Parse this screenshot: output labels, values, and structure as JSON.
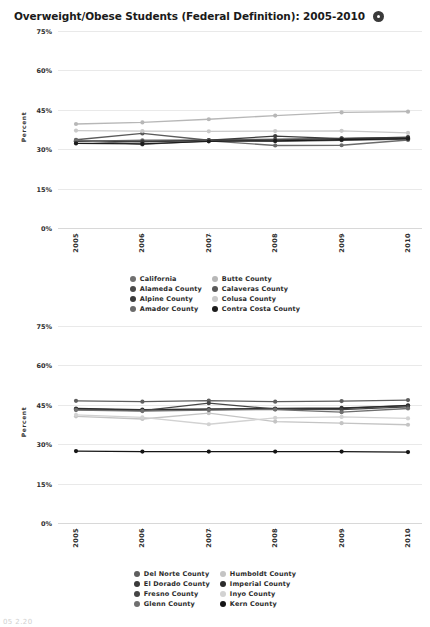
{
  "header": {
    "title": "Overweight/Obese Students (Federal Definition): 2005-2010",
    "info_icon": "info-icon"
  },
  "footer": {
    "cut_off_text": "05 2.20"
  },
  "axis": {
    "y_label": "Percent",
    "y_ticks": [
      "75%",
      "60%",
      "45%",
      "30%",
      "15%",
      "0%"
    ],
    "x_ticks": [
      "2005",
      "2006",
      "2007",
      "2008",
      "2009",
      "2010"
    ]
  },
  "chart_data": [
    {
      "type": "line",
      "title": "Overweight/Obese Students (Federal Definition): 2005-2010",
      "xlabel": "",
      "ylabel": "Percent",
      "ylim": [
        0,
        75
      ],
      "grid": true,
      "legend_position": "bottom",
      "x": [
        "2005",
        "2006",
        "2007",
        "2008",
        "2009",
        "2010"
      ],
      "series": [
        {
          "name": "California",
          "color": "#707070",
          "values": [
            33.0,
            33.4,
            33.5,
            33.8,
            34.0,
            34.2
          ]
        },
        {
          "name": "Butte County",
          "color": "#b7b7b7",
          "values": [
            39.6,
            40.2,
            41.4,
            42.8,
            44.0,
            44.3
          ]
        },
        {
          "name": "Alameda County",
          "color": "#4a4a4a",
          "values": [
            33.2,
            33.0,
            33.3,
            33.6,
            34.1,
            34.4
          ]
        },
        {
          "name": "Calaveras County",
          "color": "#5a5a5a",
          "values": [
            33.6,
            36.0,
            33.4,
            33.0,
            33.4,
            33.8
          ]
        },
        {
          "name": "Alpine County",
          "color": "#3b3b3b",
          "values": [
            33.0,
            32.8,
            33.4,
            35.0,
            34.0,
            34.6
          ]
        },
        {
          "name": "Colusa County",
          "color": "#c9c9c9",
          "values": [
            37.1,
            36.9,
            36.8,
            36.9,
            37.0,
            36.2
          ]
        },
        {
          "name": "Amador County",
          "color": "#6b6b6b",
          "values": [
            33.4,
            31.8,
            33.2,
            31.4,
            31.5,
            33.5
          ]
        },
        {
          "name": "Contra Costa County",
          "color": "#1c1c1c",
          "values": [
            32.2,
            32.0,
            33.0,
            33.2,
            33.6,
            34.0
          ]
        }
      ]
    },
    {
      "type": "line",
      "title": "",
      "xlabel": "",
      "ylabel": "Percent",
      "ylim": [
        0,
        75
      ],
      "grid": true,
      "legend_position": "bottom",
      "x": [
        "2005",
        "2006",
        "2007",
        "2008",
        "2009",
        "2010"
      ],
      "series": [
        {
          "name": "Del Norte County",
          "color": "#5e5e5e",
          "values": [
            46.5,
            46.2,
            46.6,
            46.2,
            46.4,
            46.8
          ]
        },
        {
          "name": "Humboldt County",
          "color": "#c4c4c4",
          "values": [
            40.6,
            39.6,
            41.8,
            38.6,
            38.0,
            37.4
          ]
        },
        {
          "name": "El Dorado County",
          "color": "#3a3a3a",
          "values": [
            43.6,
            43.2,
            43.4,
            43.6,
            43.8,
            44.6
          ]
        },
        {
          "name": "Imperial County",
          "color": "#2b2b2b",
          "values": [
            43.4,
            43.0,
            43.2,
            43.4,
            43.6,
            44.8
          ]
        },
        {
          "name": "Fresno County",
          "color": "#454545",
          "values": [
            43.2,
            42.8,
            45.6,
            43.4,
            43.2,
            44.2
          ]
        },
        {
          "name": "Inyo County",
          "color": "#d2d2d2",
          "values": [
            41.2,
            40.2,
            37.6,
            40.0,
            40.4,
            39.8
          ]
        },
        {
          "name": "Glenn County",
          "color": "#6f6f6f",
          "values": [
            43.0,
            42.6,
            43.0,
            43.2,
            42.2,
            43.6
          ]
        },
        {
          "name": "Kern County",
          "color": "#151515",
          "values": [
            27.4,
            27.2,
            27.2,
            27.2,
            27.2,
            27.0
          ]
        }
      ]
    }
  ]
}
